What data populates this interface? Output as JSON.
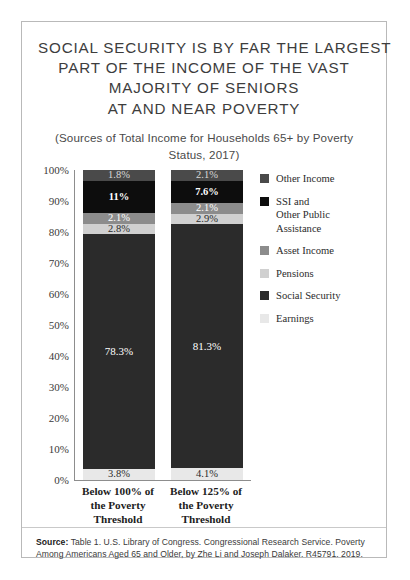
{
  "title": {
    "line1": "SOCIAL SECURITY IS BY FAR THE LARGEST",
    "line2": "PART OF THE INCOME OF THE VAST",
    "line3": "MAJORITY OF SENIORS",
    "line4": "AT AND NEAR POVERTY"
  },
  "subtitle": "(Sources of Total Income for Households 65+ by Poverty Status, 2017)",
  "source": {
    "label": "Source:",
    "text": " Table 1. U.S. Library of Congress. Congressional Research Service.  Poverty Among Americans Aged 65 and Older, by Zhe Li and Joseph Dalaker. R45791. 2019."
  },
  "chart_data": {
    "type": "bar",
    "stacked": true,
    "title": "SOCIAL SECURITY IS BY FAR THE LARGEST PART OF THE INCOME OF THE VAST MAJORITY OF SENIORS AT AND NEAR POVERTY",
    "subtitle": "(Sources of Total Income for Households 65+ by Poverty Status, 2017)",
    "xlabel": "",
    "ylabel": "",
    "ylim": [
      0,
      100
    ],
    "grid": false,
    "legend_position": "right",
    "categories": [
      "Below 100% of the Poverty Threshold",
      "Below 125% of the Poverty Threshold"
    ],
    "ytick_labels": [
      "100%",
      "90%",
      "80%",
      "70%",
      "60%",
      "50%",
      "40%",
      "30%",
      "20%",
      "10%",
      "0%"
    ],
    "series": [
      {
        "name": "Other Income",
        "color": "#4a4a4a",
        "label_color": "#d8d8d8",
        "values": [
          1.8,
          2.1
        ],
        "labels": [
          "1.8%",
          "2.1%"
        ]
      },
      {
        "name": "SSI and\nOther Public\nAssistance",
        "legend_name": "SSI and Other Public Assistance",
        "color": "#0d0d0d",
        "label_color": "#ffffff",
        "values": [
          11.0,
          7.6
        ],
        "labels": [
          "11%",
          "7.6%"
        ]
      },
      {
        "name": "Asset Income",
        "color": "#8c8c8c",
        "label_color": "#ffffff",
        "values": [
          2.1,
          2.1
        ],
        "labels": [
          "2.1%",
          "2.1%"
        ]
      },
      {
        "name": "Pensions",
        "color": "#d0d0d0",
        "label_color": "#2b2b2b",
        "values": [
          2.8,
          2.9
        ],
        "labels": [
          "2.8%",
          "2.9%"
        ]
      },
      {
        "name": "Social Security",
        "color": "#2b2b2b",
        "label_color": "#ffffff",
        "values": [
          78.3,
          81.3
        ],
        "labels": [
          "78.3%",
          "81.3%"
        ]
      },
      {
        "name": "Earnings",
        "color": "#e8e8e8",
        "label_color": "#2b2b2b",
        "values": [
          3.8,
          4.1
        ],
        "labels": [
          "3.8%",
          "4.1%"
        ]
      }
    ]
  }
}
